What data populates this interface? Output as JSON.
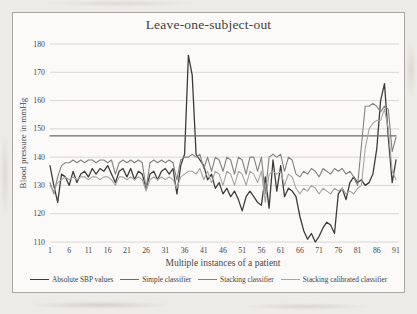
{
  "title": "Leave-one-subject-out",
  "axes": {
    "x_label": "Multiple instances of a patient",
    "y_label": "Blood pressure in mmHg"
  },
  "chart_data": {
    "type": "line",
    "title": "Leave-one-subject-out",
    "xlabel": "Multiple instances of a patient",
    "ylabel": "Blood pressure in mmHg",
    "xlim": [
      1,
      91
    ],
    "ylim": [
      110,
      180
    ],
    "x_ticks": [
      1,
      6,
      11,
      16,
      21,
      26,
      31,
      36,
      41,
      46,
      51,
      56,
      61,
      66,
      71,
      76,
      81,
      86,
      91
    ],
    "y_ticks": [
      110,
      120,
      130,
      140,
      150,
      160,
      170,
      180
    ],
    "grid": true,
    "legend_position": "bottom",
    "series": [
      {
        "name": "Absolute SBP values",
        "color": "#3d3c3a",
        "width": 1.3,
        "values": [
          137,
          130,
          124,
          134,
          133,
          130,
          135,
          131,
          134,
          135,
          133,
          136,
          134,
          136,
          135,
          137,
          134,
          131,
          135,
          136,
          133,
          136,
          132,
          135,
          134,
          129,
          134,
          135,
          132,
          135,
          136,
          134,
          136,
          127,
          137,
          141,
          176,
          169,
          141,
          139,
          137,
          132,
          134,
          129,
          131,
          127,
          129,
          126,
          128,
          125,
          121,
          126,
          128,
          126,
          124,
          123,
          133,
          122,
          139,
          128,
          137,
          126,
          129,
          128,
          126,
          119,
          114,
          111,
          113,
          110,
          112,
          115,
          117,
          116,
          113,
          127,
          129,
          125,
          131,
          133,
          131,
          132,
          130,
          131,
          134,
          143,
          160,
          166,
          147,
          131,
          139
        ]
      },
      {
        "name": "Simple classifier",
        "color": "#6b6a67",
        "width": 1.1,
        "values": [
          147.5,
          147.5,
          147.5,
          147.5,
          147.5,
          147.5,
          147.5,
          147.5,
          147.5,
          147.5,
          147.5,
          147.5,
          147.5,
          147.5,
          147.5,
          147.5,
          147.5,
          147.5,
          147.5,
          147.5,
          147.5,
          147.5,
          147.5,
          147.5,
          147.5,
          147.5,
          147.5,
          147.5,
          147.5,
          147.5,
          147.5,
          147.5,
          147.5,
          147.5,
          147.5,
          147.5,
          147.5,
          147.5,
          147.5,
          147.5,
          147.5,
          147.5,
          147.5,
          147.5,
          147.5,
          147.5,
          147.5,
          147.5,
          147.5,
          147.5,
          147.5,
          147.5,
          147.5,
          147.5,
          147.5,
          147.5,
          147.5,
          147.5,
          147.5,
          147.5,
          147.5,
          147.5,
          147.5,
          147.5,
          147.5,
          147.5,
          147.5,
          147.5,
          147.5,
          147.5,
          147.5,
          147.5,
          147.5,
          147.5,
          147.5,
          147.5,
          147.5,
          147.5,
          147.5,
          147.5,
          147.5,
          147.5,
          147.5,
          147.5,
          147.5,
          147.5,
          147.5,
          147.5,
          147.5,
          147.5,
          147.5
        ]
      },
      {
        "name": "Stacking classifier",
        "color": "#838280",
        "width": 1.1,
        "values": [
          131,
          127,
          133,
          137,
          138,
          138,
          139,
          138,
          139,
          138,
          139,
          139,
          138,
          139,
          139,
          138,
          139,
          134,
          138,
          139,
          138,
          139,
          138,
          139,
          138,
          129,
          138,
          139,
          138,
          139,
          138,
          139,
          138,
          132,
          139,
          140,
          140,
          141,
          140,
          141,
          136,
          140,
          135,
          140,
          139,
          135,
          140,
          139,
          134,
          140,
          139,
          134,
          140,
          140,
          135,
          140,
          127,
          140,
          141,
          140,
          141,
          135,
          140,
          139,
          134,
          133,
          135,
          134,
          136,
          135,
          133,
          136,
          135,
          134,
          136,
          135,
          136,
          134,
          135,
          133,
          130,
          144,
          158,
          158,
          159,
          158,
          156,
          158,
          157,
          142,
          147
        ]
      },
      {
        "name": "Stacking calibrated classifier",
        "color": "#a7a5a2",
        "width": 1.1,
        "values": [
          130,
          128,
          131,
          132,
          133,
          132,
          133,
          132,
          133,
          133,
          132,
          133,
          133,
          132,
          133,
          133,
          132,
          130,
          133,
          133,
          132,
          133,
          132,
          133,
          132,
          128,
          132,
          133,
          132,
          133,
          132,
          133,
          132,
          129,
          133,
          134,
          135,
          135,
          134,
          136,
          132,
          135,
          131,
          135,
          134,
          130,
          135,
          134,
          130,
          135,
          134,
          130,
          135,
          134,
          131,
          135,
          124,
          134,
          135,
          134,
          135,
          130,
          134,
          133,
          129,
          127,
          129,
          128,
          130,
          129,
          127,
          129,
          128,
          127,
          129,
          128,
          129,
          127,
          128,
          127,
          129,
          130,
          143,
          150,
          152,
          153,
          153,
          157,
          150,
          135,
          132
        ]
      }
    ]
  }
}
